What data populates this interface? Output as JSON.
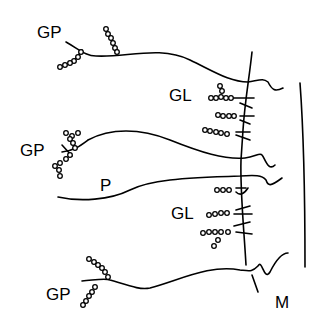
{
  "diagram": {
    "labels": {
      "gp_top": "GP",
      "gp_mid": "GP",
      "gp_bottom": "GP",
      "gl_top": "GL",
      "gl_bottom": "GL",
      "p": "P",
      "m": "M"
    },
    "colors": {
      "stroke": "#000000",
      "background": "#ffffff"
    }
  }
}
